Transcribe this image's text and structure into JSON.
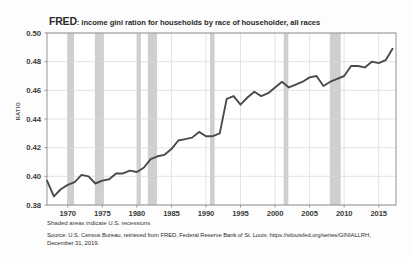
{
  "title": {
    "brand": "FRED",
    "rest": ": income gini ration for households by race of householder, all races"
  },
  "axis": {
    "ylabel": "RATIO",
    "yticks": [
      "0.50",
      "0.48",
      "0.46",
      "0.44",
      "0.42",
      "0.40",
      "0.38"
    ],
    "xticks": [
      "1970",
      "1975",
      "1980",
      "1985",
      "1990",
      "1995",
      "2000",
      "2005",
      "2010",
      "2015"
    ]
  },
  "notes": {
    "shaded": "Shaded areas indicate U.S. recessions",
    "source_line1": "Source: U.S. Census Bureau, retrieved from FRED, Federal Reserve Bank of St. Louis; https://stlouisfed.org/series/GINIALLRH,",
    "source_line2": "December 31, 2019."
  },
  "colors": {
    "line": "#4a4a4a",
    "recession": "#cfcfcf",
    "grid": "#d9d9d9",
    "frame": "#8a8a8a",
    "background": "#ffffff"
  },
  "chart_data": {
    "type": "line",
    "title": "FRED: income gini ration for households by race of householder, all races",
    "xlabel": "",
    "ylabel": "RATIO",
    "xlim": [
      1967,
      2017.5
    ],
    "ylim": [
      0.38,
      0.5
    ],
    "grid": true,
    "legend": null,
    "series": [
      {
        "name": "GINIALLRH",
        "x": [
          1967,
          1968,
          1969,
          1970,
          1971,
          1972,
          1973,
          1974,
          1975,
          1976,
          1977,
          1978,
          1979,
          1980,
          1981,
          1982,
          1983,
          1984,
          1985,
          1986,
          1987,
          1988,
          1989,
          1990,
          1991,
          1992,
          1993,
          1994,
          1995,
          1996,
          1997,
          1998,
          1999,
          2000,
          2001,
          2002,
          2003,
          2004,
          2005,
          2006,
          2007,
          2008,
          2009,
          2010,
          2011,
          2012,
          2013,
          2014,
          2015,
          2016,
          2017
        ],
        "values": [
          0.397,
          0.386,
          0.391,
          0.394,
          0.396,
          0.401,
          0.4,
          0.395,
          0.397,
          0.398,
          0.402,
          0.402,
          0.404,
          0.403,
          0.406,
          0.412,
          0.414,
          0.415,
          0.419,
          0.425,
          0.426,
          0.427,
          0.431,
          0.428,
          0.428,
          0.43,
          0.454,
          0.456,
          0.45,
          0.455,
          0.459,
          0.456,
          0.458,
          0.462,
          0.466,
          0.462,
          0.464,
          0.466,
          0.469,
          0.47,
          0.463,
          0.466,
          0.468,
          0.47,
          0.477,
          0.477,
          0.476,
          0.48,
          0.479,
          0.481,
          0.489
        ]
      }
    ],
    "recession_bands": [
      {
        "start": 1969.92,
        "end": 1970.92
      },
      {
        "start": 1973.92,
        "end": 1975.25
      },
      {
        "start": 1980.0,
        "end": 1980.58
      },
      {
        "start": 1981.58,
        "end": 1982.92
      },
      {
        "start": 1990.58,
        "end": 1991.25
      },
      {
        "start": 2001.25,
        "end": 2001.92
      },
      {
        "start": 2007.92,
        "end": 2009.5
      }
    ]
  }
}
